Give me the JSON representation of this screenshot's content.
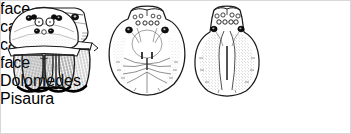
{
  "plate": {
    "background_color": "#ffffff",
    "ink_color": "#1a1a1a",
    "width": 351,
    "height": 134,
    "subject": "pisaurid spider head and carapace comparison plate"
  },
  "figures": [
    {
      "id": "dolomedes-face",
      "view": "face",
      "genus": "Dolomedes",
      "description": "anterior view of head showing eight eyes in two rows and two hairy chelicerae"
    },
    {
      "id": "dolomedes-carapace",
      "view": "carapace",
      "genus": "Dolomedes",
      "description": "dorsal view of broad rounded carapace with radiating striae"
    },
    {
      "id": "pisaura-carapace",
      "view": "carapace",
      "genus": "Pisaura",
      "description": "dorsal view of narrower carapace with pale median band"
    },
    {
      "id": "pisaura-face",
      "view": "face",
      "genus": "Pisaura",
      "description": "anterior view of domed head with eight eyes and two hairy chelicerae"
    }
  ],
  "captions": {
    "dolomedes_face": "face",
    "dolomedes_carapace": "carapace",
    "pisaura_carapace": "carapace",
    "pisaura_face": "face"
  },
  "genus_labels": {
    "left": "Dolomedes",
    "right": "Pisaura"
  }
}
